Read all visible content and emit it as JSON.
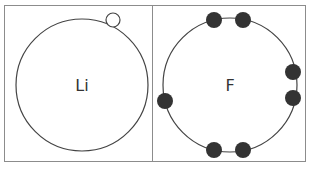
{
  "colors": {
    "frame": "#8c8c8c",
    "shell": "#444444",
    "electron_fill": "#333333",
    "hollow_fill": "#ffffff",
    "text": "#333333"
  },
  "panels": [
    {
      "name": "lithium",
      "symbol": "Li",
      "shell": {
        "cx": 82,
        "cy": 85,
        "r": 66
      },
      "electrons": [
        {
          "cx": 113,
          "cy": 20,
          "r": 7,
          "filled": false
        }
      ]
    },
    {
      "name": "fluorine",
      "symbol": "F",
      "shell": {
        "cx": 230,
        "cy": 85,
        "r": 67
      },
      "electrons": [
        {
          "cx": 214,
          "cy": 20,
          "r": 8,
          "filled": true
        },
        {
          "cx": 243,
          "cy": 20,
          "r": 8,
          "filled": true
        },
        {
          "cx": 293,
          "cy": 72,
          "r": 8,
          "filled": true
        },
        {
          "cx": 293,
          "cy": 98,
          "r": 8,
          "filled": true
        },
        {
          "cx": 165,
          "cy": 101,
          "r": 8,
          "filled": true
        },
        {
          "cx": 214,
          "cy": 150,
          "r": 8,
          "filled": true
        },
        {
          "cx": 243,
          "cy": 150,
          "r": 8,
          "filled": true
        }
      ]
    }
  ]
}
